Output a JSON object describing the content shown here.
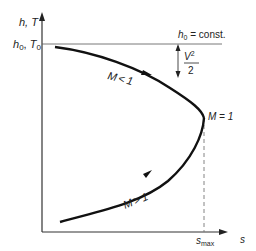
{
  "diagram": {
    "type": "h-s diagram (Fanno line)",
    "y_axis_label": "h, T",
    "x_axis_label": "s",
    "stagnation_label": "h0, T0",
    "stagnation_label_parts": {
      "h": "h",
      "h_sub": "0",
      "sep": ", ",
      "T": "T",
      "T_sub": "0"
    },
    "constant_line_label": {
      "h": "h",
      "sub": "0",
      "rest": " = const."
    },
    "kinetic_energy_label": {
      "numerator": "V",
      "exponent": "2",
      "denominator": "2"
    },
    "branches": [
      {
        "label": "M < 1",
        "M": "M",
        "op": "<",
        "val": "1"
      },
      {
        "label": "M > 1",
        "M": "M",
        "op": ">",
        "val": "1"
      }
    ],
    "sonic_point_label": "M = 1",
    "s_max_label": {
      "s": "s",
      "sub": "max"
    },
    "colors": {
      "line": "#1a1a1a",
      "thin": "#444444",
      "dashed": "#777777"
    }
  }
}
